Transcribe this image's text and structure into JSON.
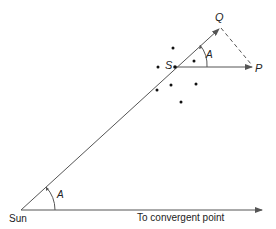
{
  "diagram": {
    "labels": {
      "sun": "Sun",
      "star": "S",
      "q": "Q",
      "p": "P",
      "angle_star": "A",
      "angle_sun": "A",
      "baseline": "To convergent point"
    },
    "colors": {
      "line": "#555555",
      "dot": "#111111",
      "text": "#222222"
    }
  }
}
